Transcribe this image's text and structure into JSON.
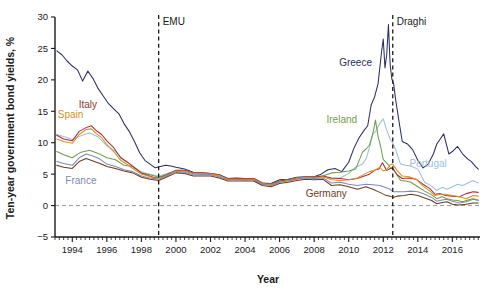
{
  "chart_data": {
    "type": "line",
    "title": "",
    "xlabel": "Year",
    "ylabel": "Ten-year government bond yields, %",
    "xlim": [
      1993.0,
      2017.6
    ],
    "ylim": [
      -5,
      30
    ],
    "grid": false,
    "legend_position": "inline-annotations",
    "y_ticks": [
      -5,
      0,
      5,
      10,
      15,
      20,
      25,
      30
    ],
    "x_ticks": [
      1994,
      1996,
      1998,
      2000,
      2002,
      2004,
      2006,
      2008,
      2010,
      2012,
      2014,
      2016
    ],
    "x_minor_tick_step": 0.25,
    "zero_reference_line": 0,
    "annotations": [
      {
        "name": "EMU",
        "label": "EMU",
        "x": 1999.0,
        "type": "vertical-dashed-line"
      },
      {
        "name": "Draghi",
        "label": "Draghi",
        "x": 2012.55,
        "type": "vertical-dashed-line"
      }
    ],
    "series_labels": [
      {
        "name": "Greece",
        "label": "Greece",
        "x": 2010.4,
        "y": 22.2,
        "color": "#2a2f5e"
      },
      {
        "name": "Ireland",
        "label": "Ireland",
        "x": 2009.6,
        "y": 13.2,
        "color": "#6f9e4a"
      },
      {
        "name": "Portugal",
        "label": "Portugal",
        "x": 2014.6,
        "y": 6.2,
        "color": "#9ec0dd"
      },
      {
        "name": "Italy",
        "label": "Italy",
        "x": 1994.9,
        "y": 15.6,
        "color": "#a8302a"
      },
      {
        "name": "Spain",
        "label": "Spain",
        "x": 1993.9,
        "y": 13.9,
        "color": "#d4922e"
      },
      {
        "name": "France",
        "label": "France",
        "x": 1994.5,
        "y": 3.4,
        "color": "#7b8bb5"
      },
      {
        "name": "Germany",
        "label": "Germany",
        "x": 2008.7,
        "y": 1.4,
        "color": "#6d3b1f"
      }
    ],
    "series": [
      {
        "name": "Greece",
        "color": "#2a2f5e",
        "x": [
          1993.1,
          1993.4,
          1993.7,
          1994.0,
          1994.3,
          1994.6,
          1994.9,
          1995.2,
          1995.5,
          1995.8,
          1996.1,
          1996.4,
          1996.7,
          1997.0,
          1997.3,
          1997.6,
          1997.9,
          1998.2,
          1998.5,
          1998.8,
          1999.1,
          1999.4,
          1999.7,
          2000.0,
          2000.5,
          2001.0,
          2001.5,
          2002.0,
          2002.5,
          2003.0,
          2003.5,
          2004.0,
          2004.5,
          2005.0,
          2005.5,
          2006.0,
          2006.5,
          2007.0,
          2007.5,
          2008.0,
          2008.4,
          2008.8,
          2009.2,
          2009.6,
          2010.0,
          2010.3,
          2010.6,
          2010.9,
          2011.1,
          2011.3,
          2011.5,
          2011.7,
          2011.9,
          2012.0,
          2012.1,
          2012.2,
          2012.3,
          2012.4,
          2012.5,
          2012.6,
          2012.7,
          2012.9,
          2013.1,
          2013.4,
          2013.7,
          2014.0,
          2014.3,
          2014.6,
          2014.9,
          2015.1,
          2015.3,
          2015.5,
          2015.8,
          2016.0,
          2016.3,
          2016.6,
          2016.9,
          2017.1,
          2017.35,
          2017.5
        ],
        "y": [
          24.6,
          24.0,
          23.0,
          22.2,
          21.6,
          19.8,
          21.4,
          20.2,
          18.6,
          17.4,
          16.2,
          15.4,
          14.6,
          13.0,
          11.8,
          10.2,
          8.4,
          7.2,
          6.6,
          6.0,
          6.2,
          6.4,
          6.3,
          6.1,
          5.8,
          5.3,
          5.2,
          5.1,
          4.9,
          4.3,
          4.4,
          4.3,
          4.3,
          3.6,
          3.5,
          4.1,
          4.2,
          4.5,
          4.6,
          4.6,
          5.0,
          5.7,
          5.9,
          5.4,
          6.9,
          9.1,
          10.8,
          12.0,
          12.7,
          16.0,
          17.3,
          19.4,
          24.4,
          26.5,
          21.9,
          24.0,
          28.8,
          22.4,
          20.1,
          19.4,
          17.2,
          13.6,
          10.2,
          9.8,
          8.9,
          7.2,
          6.0,
          6.6,
          8.2,
          9.8,
          10.6,
          11.4,
          8.2,
          8.6,
          9.4,
          8.2,
          7.4,
          7.0,
          6.2,
          5.8
        ]
      },
      {
        "name": "Portugal",
        "color": "#9ec0dd",
        "x": [
          1993.1,
          1993.5,
          1994.0,
          1994.5,
          1995.0,
          1995.5,
          1996.0,
          1996.5,
          1997.0,
          1997.5,
          1998.0,
          1998.5,
          1999.0,
          1999.5,
          2000.0,
          2000.5,
          2001.0,
          2001.5,
          2002.0,
          2002.5,
          2003.0,
          2003.5,
          2004.0,
          2004.5,
          2005.0,
          2005.5,
          2006.0,
          2006.5,
          2007.0,
          2007.5,
          2008.0,
          2008.5,
          2009.0,
          2009.5,
          2010.0,
          2010.4,
          2010.8,
          2011.0,
          2011.2,
          2011.4,
          2011.6,
          2011.8,
          2012.0,
          2012.2,
          2012.4,
          2012.55,
          2012.7,
          2013.0,
          2013.3,
          2013.6,
          2014.0,
          2014.4,
          2014.8,
          2015.1,
          2015.4,
          2015.7,
          2016.0,
          2016.3,
          2016.6,
          2016.9,
          2017.2,
          2017.5
        ],
        "y": [
          11.3,
          11.0,
          10.5,
          11.1,
          11.6,
          10.9,
          9.5,
          8.6,
          7.2,
          6.3,
          5.4,
          5.0,
          4.7,
          5.1,
          5.6,
          5.6,
          5.2,
          5.2,
          5.1,
          4.9,
          4.3,
          4.3,
          4.2,
          4.3,
          3.6,
          3.4,
          3.9,
          4.1,
          4.4,
          4.6,
          4.5,
          4.6,
          4.3,
          4.4,
          5.1,
          6.1,
          6.6,
          7.4,
          9.2,
          11.3,
          12.0,
          13.1,
          13.8,
          12.0,
          10.6,
          10.0,
          9.0,
          6.6,
          6.4,
          6.3,
          5.8,
          3.7,
          3.1,
          2.4,
          2.9,
          2.6,
          3.0,
          3.4,
          3.2,
          3.6,
          4.0,
          3.6
        ]
      },
      {
        "name": "Ireland",
        "color": "#6f9e4a",
        "x": [
          1993.1,
          1993.5,
          1994.0,
          1994.5,
          1995.0,
          1995.5,
          1996.0,
          1996.5,
          1997.0,
          1997.5,
          1998.0,
          1998.5,
          1999.0,
          1999.5,
          2000.0,
          2000.5,
          2001.0,
          2001.5,
          2002.0,
          2002.5,
          2003.0,
          2003.5,
          2004.0,
          2004.5,
          2005.0,
          2005.5,
          2006.0,
          2006.5,
          2007.0,
          2007.5,
          2008.0,
          2008.5,
          2009.0,
          2009.5,
          2010.0,
          2010.4,
          2010.8,
          2011.0,
          2011.2,
          2011.4,
          2011.55,
          2011.7,
          2011.85,
          2012.0,
          2012.2,
          2012.4,
          2012.55,
          2012.7,
          2013.0,
          2013.3,
          2013.6,
          2014.0,
          2014.4,
          2014.8,
          2015.1,
          2015.4,
          2015.7,
          2016.0,
          2016.3,
          2016.6,
          2016.9,
          2017.2,
          2017.5
        ],
        "y": [
          8.6,
          8.1,
          7.6,
          8.5,
          8.8,
          8.3,
          7.6,
          7.3,
          6.4,
          6.2,
          5.2,
          4.9,
          4.5,
          5.0,
          5.5,
          5.5,
          5.1,
          5.0,
          5.0,
          4.8,
          4.2,
          4.2,
          4.1,
          4.2,
          3.4,
          3.3,
          3.8,
          4.0,
          4.3,
          4.5,
          4.5,
          4.7,
          5.2,
          5.3,
          5.5,
          5.8,
          8.5,
          9.0,
          9.6,
          11.5,
          13.6,
          11.0,
          9.4,
          7.3,
          6.8,
          6.1,
          6.0,
          5.3,
          4.0,
          3.9,
          3.7,
          3.0,
          2.3,
          1.7,
          1.1,
          1.4,
          1.1,
          0.9,
          0.8,
          0.6,
          0.9,
          1.1,
          0.9
        ]
      },
      {
        "name": "Italy",
        "color": "#a8302a",
        "x": [
          1993.1,
          1993.5,
          1994.0,
          1994.4,
          1994.8,
          1995.1,
          1995.4,
          1995.7,
          1996.0,
          1996.4,
          1996.8,
          1997.2,
          1997.6,
          1998.0,
          1998.4,
          1998.8,
          1999.2,
          1999.6,
          2000.0,
          2000.5,
          2001.0,
          2001.5,
          2002.0,
          2002.5,
          2003.0,
          2003.5,
          2004.0,
          2004.5,
          2005.0,
          2005.5,
          2006.0,
          2006.5,
          2007.0,
          2007.5,
          2008.0,
          2008.5,
          2009.0,
          2009.5,
          2010.0,
          2010.5,
          2010.9,
          2011.2,
          2011.5,
          2011.75,
          2011.95,
          2012.2,
          2012.4,
          2012.55,
          2012.8,
          2013.1,
          2013.5,
          2013.9,
          2014.3,
          2014.7,
          2015.0,
          2015.3,
          2015.6,
          2016.0,
          2016.4,
          2016.8,
          2017.2,
          2017.5
        ],
        "y": [
          11.2,
          10.6,
          10.3,
          11.8,
          12.4,
          12.7,
          11.9,
          11.3,
          10.3,
          9.2,
          7.6,
          6.9,
          6.0,
          5.2,
          4.8,
          4.4,
          4.6,
          5.1,
          5.6,
          5.6,
          5.2,
          5.2,
          5.1,
          4.9,
          4.3,
          4.3,
          4.3,
          4.3,
          3.6,
          3.4,
          3.9,
          4.1,
          4.4,
          4.6,
          4.5,
          4.7,
          4.4,
          4.3,
          4.1,
          4.3,
          4.7,
          5.0,
          5.6,
          5.8,
          6.8,
          5.6,
          5.9,
          5.9,
          4.9,
          4.3,
          4.4,
          4.2,
          3.4,
          2.7,
          1.8,
          1.9,
          1.6,
          1.5,
          1.4,
          1.9,
          2.2,
          2.1
        ]
      },
      {
        "name": "Spain",
        "color": "#d4922e",
        "x": [
          1993.1,
          1993.5,
          1994.0,
          1994.4,
          1994.8,
          1995.1,
          1995.4,
          1995.7,
          1996.0,
          1996.4,
          1996.8,
          1997.2,
          1997.6,
          1998.0,
          1998.4,
          1998.8,
          1999.2,
          1999.6,
          2000.0,
          2000.5,
          2001.0,
          2001.5,
          2002.0,
          2002.5,
          2003.0,
          2003.5,
          2004.0,
          2004.5,
          2005.0,
          2005.5,
          2006.0,
          2006.5,
          2007.0,
          2007.5,
          2008.0,
          2008.5,
          2009.0,
          2009.5,
          2010.0,
          2010.5,
          2010.9,
          2011.2,
          2011.5,
          2011.8,
          2012.0,
          2012.2,
          2012.4,
          2012.55,
          2012.8,
          2013.1,
          2013.5,
          2013.9,
          2014.3,
          2014.7,
          2015.0,
          2015.3,
          2015.6,
          2016.0,
          2016.4,
          2016.8,
          2017.2,
          2017.5
        ],
        "y": [
          10.6,
          10.2,
          9.9,
          11.3,
          12.1,
          12.2,
          11.4,
          10.8,
          9.7,
          8.6,
          7.2,
          6.5,
          5.7,
          5.0,
          4.7,
          4.3,
          4.5,
          5.0,
          5.5,
          5.5,
          5.1,
          5.1,
          5.0,
          4.8,
          4.2,
          4.2,
          4.2,
          4.2,
          3.5,
          3.3,
          3.8,
          4.0,
          4.3,
          4.5,
          4.4,
          4.6,
          4.1,
          4.0,
          4.1,
          4.4,
          5.0,
          5.4,
          5.6,
          6.1,
          5.5,
          5.7,
          6.5,
          6.6,
          5.6,
          4.7,
          4.6,
          4.2,
          3.1,
          2.3,
          1.6,
          1.8,
          1.8,
          1.6,
          1.4,
          1.1,
          1.6,
          1.5
        ]
      },
      {
        "name": "France",
        "color": "#7b8bb5",
        "x": [
          1993.1,
          1993.5,
          1994.0,
          1994.4,
          1994.8,
          1995.2,
          1995.6,
          1996.0,
          1996.5,
          1997.0,
          1997.5,
          1998.0,
          1998.5,
          1999.0,
          1999.5,
          2000.0,
          2000.5,
          2001.0,
          2001.5,
          2002.0,
          2002.5,
          2003.0,
          2003.5,
          2004.0,
          2004.5,
          2005.0,
          2005.5,
          2006.0,
          2006.5,
          2007.0,
          2007.5,
          2008.0,
          2008.5,
          2009.0,
          2009.5,
          2010.0,
          2010.5,
          2011.0,
          2011.4,
          2011.8,
          2012.1,
          2012.4,
          2012.55,
          2012.8,
          2013.2,
          2013.6,
          2014.0,
          2014.4,
          2014.8,
          2015.1,
          2015.4,
          2015.7,
          2016.0,
          2016.4,
          2016.8,
          2017.2,
          2017.5
        ],
        "y": [
          7.0,
          6.7,
          6.4,
          7.6,
          8.2,
          7.9,
          7.4,
          6.6,
          6.2,
          5.7,
          5.4,
          4.7,
          4.4,
          4.2,
          4.8,
          5.4,
          5.3,
          4.9,
          4.9,
          4.9,
          4.6,
          4.1,
          4.1,
          4.1,
          4.1,
          3.4,
          3.2,
          3.7,
          3.9,
          4.2,
          4.4,
          4.3,
          4.4,
          3.6,
          3.7,
          3.4,
          3.2,
          3.4,
          3.3,
          3.2,
          2.9,
          2.6,
          2.2,
          2.2,
          2.2,
          2.3,
          2.2,
          1.8,
          1.3,
          0.7,
          0.9,
          1.0,
          0.7,
          0.4,
          0.6,
          1.0,
          0.8
        ]
      },
      {
        "name": "Germany",
        "color": "#6d3b1f",
        "x": [
          1993.1,
          1993.5,
          1994.0,
          1994.4,
          1994.8,
          1995.2,
          1995.6,
          1996.0,
          1996.5,
          1997.0,
          1997.5,
          1998.0,
          1998.5,
          1999.0,
          1999.5,
          2000.0,
          2000.5,
          2001.0,
          2001.5,
          2002.0,
          2002.5,
          2003.0,
          2003.5,
          2004.0,
          2004.5,
          2005.0,
          2005.5,
          2006.0,
          2006.5,
          2007.0,
          2007.5,
          2008.0,
          2008.5,
          2009.0,
          2009.5,
          2010.0,
          2010.5,
          2011.0,
          2011.4,
          2011.8,
          2012.1,
          2012.4,
          2012.55,
          2012.8,
          2013.2,
          2013.6,
          2014.0,
          2014.4,
          2014.8,
          2015.1,
          2015.4,
          2015.7,
          2016.0,
          2016.4,
          2016.8,
          2017.2,
          2017.5
        ],
        "y": [
          6.4,
          6.1,
          5.9,
          7.0,
          7.5,
          7.1,
          6.7,
          6.2,
          5.9,
          5.5,
          5.2,
          4.5,
          4.2,
          4.0,
          4.6,
          5.2,
          5.1,
          4.7,
          4.7,
          4.7,
          4.4,
          3.9,
          3.9,
          3.9,
          3.9,
          3.2,
          3.0,
          3.5,
          3.7,
          4.0,
          4.2,
          4.1,
          4.2,
          3.2,
          3.3,
          3.0,
          2.6,
          3.0,
          2.6,
          2.1,
          1.7,
          1.5,
          1.3,
          1.5,
          1.6,
          1.8,
          1.6,
          1.2,
          0.8,
          0.3,
          0.5,
          0.6,
          0.2,
          0.1,
          0.2,
          0.4,
          0.4
        ]
      }
    ]
  }
}
